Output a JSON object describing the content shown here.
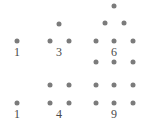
{
  "figure": {
    "width": 156,
    "height": 125,
    "background_color": "#ffffff",
    "dot_color": "#7b7b7b",
    "label_color": "#4a4a4a",
    "dot_radius": 2.5
  },
  "groups": [
    {
      "id": "triangular-1",
      "label": "1",
      "label_x": 17,
      "label_y": 46,
      "shape": "triangular",
      "count": 1,
      "dots": [
        {
          "x": 17,
          "y": 41
        }
      ]
    },
    {
      "id": "triangular-3",
      "label": "3",
      "label_x": 59,
      "label_y": 46,
      "shape": "triangular",
      "count": 3,
      "dots": [
        {
          "x": 59,
          "y": 24
        },
        {
          "x": 50,
          "y": 41
        },
        {
          "x": 69,
          "y": 41
        }
      ]
    },
    {
      "id": "triangular-6",
      "label": "6",
      "label_x": 114,
      "label_y": 46,
      "shape": "triangular",
      "count": 6,
      "dots": [
        {
          "x": 114,
          "y": 6
        },
        {
          "x": 105,
          "y": 23
        },
        {
          "x": 124,
          "y": 23
        },
        {
          "x": 96,
          "y": 41
        },
        {
          "x": 114,
          "y": 41
        },
        {
          "x": 133,
          "y": 41
        }
      ]
    },
    {
      "id": "square-1",
      "label": "1",
      "label_x": 17,
      "label_y": 108,
      "shape": "square",
      "count": 1,
      "dots": [
        {
          "x": 17,
          "y": 103
        }
      ]
    },
    {
      "id": "square-4",
      "label": "4",
      "label_x": 59,
      "label_y": 108,
      "shape": "square",
      "count": 4,
      "dots": [
        {
          "x": 50,
          "y": 85
        },
        {
          "x": 69,
          "y": 85
        },
        {
          "x": 50,
          "y": 103
        },
        {
          "x": 69,
          "y": 103
        }
      ]
    },
    {
      "id": "square-9",
      "label": "9",
      "label_x": 114,
      "label_y": 108,
      "shape": "square",
      "count": 9,
      "dots": [
        {
          "x": 96,
          "y": 62
        },
        {
          "x": 114,
          "y": 62
        },
        {
          "x": 133,
          "y": 62
        },
        {
          "x": 96,
          "y": 85
        },
        {
          "x": 114,
          "y": 85
        },
        {
          "x": 133,
          "y": 85
        },
        {
          "x": 96,
          "y": 103
        },
        {
          "x": 114,
          "y": 103
        },
        {
          "x": 133,
          "y": 103
        }
      ]
    }
  ],
  "chart_data": {
    "type": "scatter",
    "title": "",
    "xlabel": "",
    "ylabel": "",
    "series": [
      {
        "name": "triangular numbers",
        "values": [
          1,
          3,
          6
        ]
      },
      {
        "name": "square numbers",
        "values": [
          1,
          4,
          9
        ]
      }
    ],
    "categories": [
      "first",
      "second",
      "third"
    ],
    "annotations": [
      "1",
      "3",
      "6",
      "1",
      "4",
      "9"
    ],
    "legend": "none",
    "grid": false
  }
}
